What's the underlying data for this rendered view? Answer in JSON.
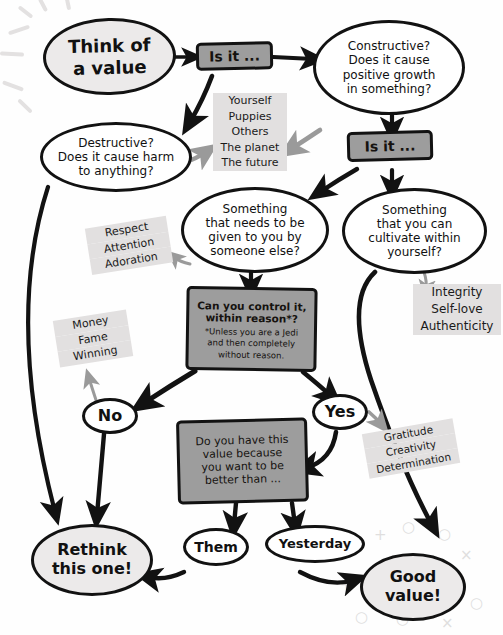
{
  "nodes": {
    "start": "Think of\na value",
    "isit_1": "Is it ...",
    "isit_2": "Is it ...",
    "constructive": "Constructive?\nDoes it cause\npositive growth\nin something?",
    "destructive": "Destructive?\nDoes it cause harm\nto anything?",
    "given_by_else": "Something\nthat needs to be\ngiven to you by\nsomeone else?",
    "cultivate_within": "Something\nthat you can\ncultivate within\nyourself?",
    "control_q": "Can you control it,\nwithin reason*?",
    "control_footnote": "*Unless you are a Jedi\nand then completely\nwithout reason.",
    "no": "No",
    "yes": "Yes",
    "better_than": "Do you have this\nvalue because\nyou want to be\nbetter than ...",
    "them": "Them",
    "yesterday": "Yesterday",
    "rethink": "Rethink\nthis one!",
    "good_value": "Good\nvalue!"
  },
  "word_lists": {
    "destructive_targets": [
      "Yourself",
      "Puppies",
      "Others",
      "The planet",
      "The future"
    ],
    "given_examples": [
      "Respect",
      "Attention",
      "Adoration"
    ],
    "no_examples": [
      "Money",
      "Fame",
      "Winning"
    ],
    "cultivate_examples": [
      "Integrity",
      "Self-love",
      "Authenticity"
    ],
    "yes_examples": [
      "Gratitude",
      "Creativity",
      "Determination"
    ]
  },
  "colors": {
    "ink": "#121212",
    "gray_box_fill": "#9d9d9d",
    "bubble_fill": "#eceaea",
    "highlight": "#e2e0e0",
    "gray_arrow": "#9a9a9a",
    "decoration": "#e3e1e1",
    "page": "#fefefe"
  }
}
